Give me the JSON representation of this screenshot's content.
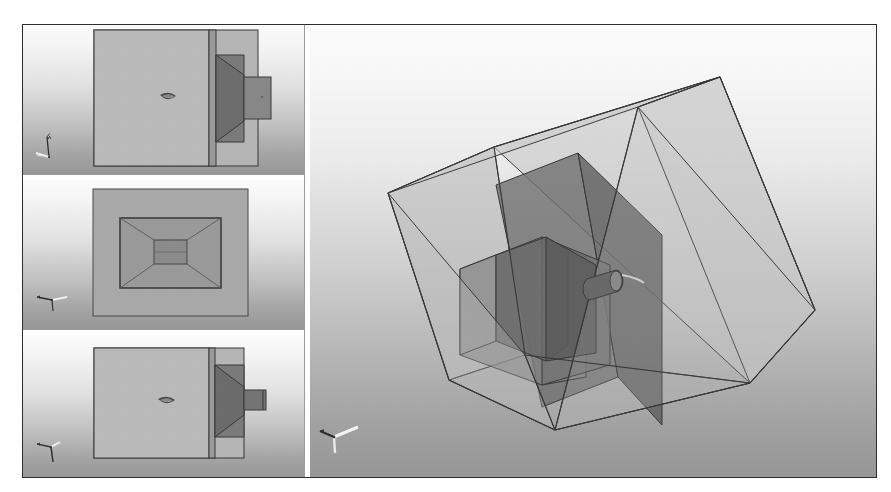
{
  "window": {
    "title": "CAD Multi-View Nozzle Geometry",
    "border_color": "#2e2e2e",
    "splitter_color": "#9b9b9b"
  },
  "layout": {
    "panes": 4,
    "left_column_width": 281,
    "orientation": "three-stacked-orthographic-plus-isometric"
  },
  "palette": {
    "background_top": "#ffffff",
    "background_bottom": "#9a9a9a",
    "body_fill": "#b7b7b7",
    "body_mid_fill": "#a0a0a0",
    "nozzle_fill": "#7e7e7e",
    "nozzle_dark_fill": "#6a6a6a",
    "edge_line": "#3a3a3a",
    "box_face_light": "#c6c6c6",
    "box_face_mid": "#b4b4b4",
    "box_face_dark": "#a2a2a2",
    "inner_solid": "#707070",
    "axis_glyph_light": "#ffffff",
    "axis_glyph_dark": "#2a2a2a"
  },
  "viewports": [
    {
      "id": "top-view",
      "name": "Top orthographic view",
      "projection": "orthographic",
      "camera": "top",
      "axis_triad": "xyz-triad-icon",
      "shapes": [
        {
          "name": "outer-domain-rect",
          "role": "fluid domain outline"
        },
        {
          "name": "inlet-plenum-rect",
          "role": "large upstream chamber"
        },
        {
          "name": "wall-strip",
          "role": "vertical separating wall"
        },
        {
          "name": "converging-nozzle-trapezoid",
          "role": "converging section"
        },
        {
          "name": "throat-extension-rect",
          "role": "throat / outlet duct"
        },
        {
          "name": "probe-marker",
          "role": "lens-shaped probe/monitor marker"
        }
      ]
    },
    {
      "id": "front-view",
      "name": "Front orthographic view",
      "projection": "orthographic",
      "camera": "front",
      "axis_triad": "xyz-triad-icon",
      "shapes": [
        {
          "name": "outer-domain-rect",
          "role": "fluid domain outline"
        },
        {
          "name": "inner-frame-rect",
          "role": "nozzle outer boundary seen axially"
        },
        {
          "name": "perspective-converging-lines",
          "role": "nozzle wall convergence"
        },
        {
          "name": "throat-rect",
          "role": "throat opening"
        }
      ]
    },
    {
      "id": "side-view",
      "name": "Side orthographic view",
      "projection": "orthographic",
      "camera": "side",
      "axis_triad": "xyz-triad-icon",
      "shapes": [
        {
          "name": "outer-domain-rect",
          "role": "fluid domain outline"
        },
        {
          "name": "inlet-plenum-rect",
          "role": "large upstream chamber"
        },
        {
          "name": "wall-strip",
          "role": "vertical separating wall"
        },
        {
          "name": "converging-nozzle-trapezoid",
          "role": "converging section"
        },
        {
          "name": "throat-extension-rect",
          "role": "narrow throat duct"
        },
        {
          "name": "probe-marker",
          "role": "lens-shaped probe/monitor marker"
        }
      ]
    },
    {
      "id": "iso-view",
      "name": "Isometric 3D view",
      "projection": "perspective",
      "camera": "isometric",
      "axis_triad": "xyz-triad-icon",
      "shapes": [
        {
          "name": "transparent-bounding-box",
          "role": "semi-transparent fluid domain"
        },
        {
          "name": "internal-baffle-plate",
          "role": "dark interior plate"
        },
        {
          "name": "converging-nozzle-solid",
          "role": "nozzle body"
        },
        {
          "name": "throat-duct-solid",
          "role": "throat duct"
        },
        {
          "name": "cylindrical-probe",
          "role": "small cylindrical probe/injector"
        }
      ]
    }
  ]
}
